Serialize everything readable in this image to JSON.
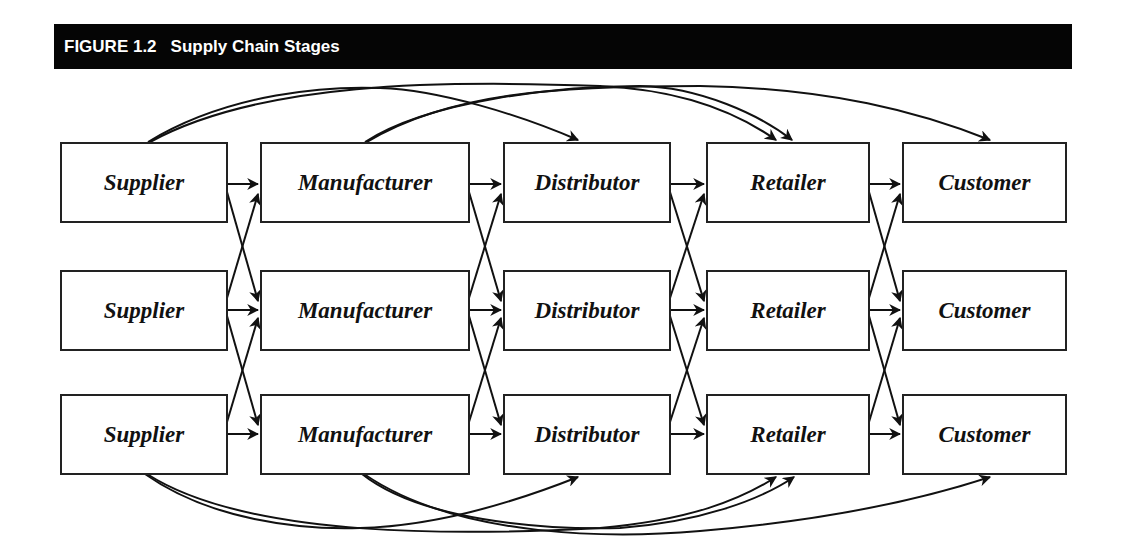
{
  "figure": {
    "number": "FIGURE 1.2",
    "title": "Supply Chain Stages"
  },
  "stages": [
    "Supplier",
    "Manufacturer",
    "Distributor",
    "Retailer",
    "Customer"
  ],
  "rows": 3,
  "nodes": {
    "r0": [
      "Supplier",
      "Manufacturer",
      "Distributor",
      "Retailer",
      "Customer"
    ],
    "r1": [
      "Supplier",
      "Manufacturer",
      "Distributor",
      "Retailer",
      "Customer"
    ],
    "r2": [
      "Supplier",
      "Manufacturer",
      "Distributor",
      "Retailer",
      "Customer"
    ]
  },
  "connections": {
    "adjacent": "each stage box connects to all three boxes of the next stage (straight and crossing arrows)",
    "skip_arcs_top": [
      {
        "from": "Supplier (row 1)",
        "to": "Distributor (row 1)"
      },
      {
        "from": "Supplier (row 1)",
        "to": "Retailer (row 1)"
      },
      {
        "from": "Manufacturer (row 1)",
        "to": "Retailer (row 1)"
      },
      {
        "from": "Manufacturer (row 1)",
        "to": "Customer (row 1)"
      }
    ],
    "skip_arcs_bottom": [
      {
        "from": "Supplier (row 3)",
        "to": "Distributor (row 3)"
      },
      {
        "from": "Supplier (row 3)",
        "to": "Retailer (row 3)"
      },
      {
        "from": "Manufacturer (row 3)",
        "to": "Retailer (row 3)"
      },
      {
        "from": "Manufacturer (row 3)",
        "to": "Customer (row 3)"
      }
    ]
  },
  "colors": {
    "header_bg": "#050505",
    "header_text": "#ffffff",
    "line": "#111111",
    "box_border": "#222222"
  }
}
